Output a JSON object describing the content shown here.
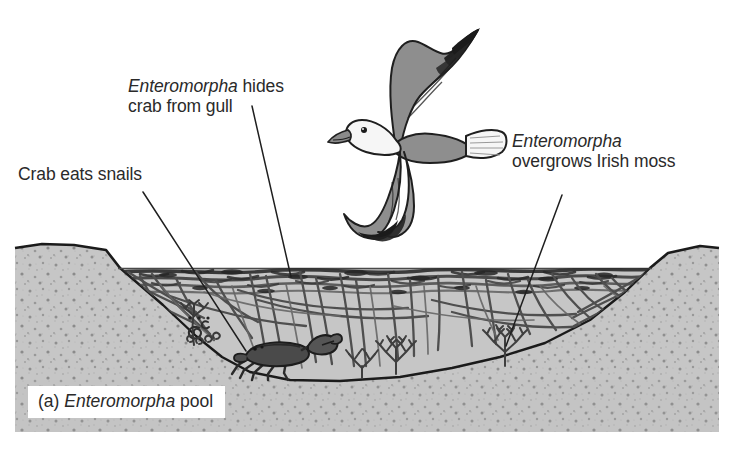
{
  "figure": {
    "caption_prefix": "(a) ",
    "caption_species": "Enteromorpha",
    "caption_suffix": " pool",
    "caption_full": "(a) Enteromorpha pool"
  },
  "labels": [
    {
      "id": "enteromorpha-hides-crab-from-gull",
      "species": "Enteromorpha",
      "rest": " hides\ncrab from gull",
      "full": "Enteromorpha hides crab from gull",
      "leader": {
        "x1": 252,
        "y1": 106,
        "x2": 291,
        "y2": 277
      }
    },
    {
      "id": "crab-eats-snails",
      "species": "",
      "rest": "Crab eats snails",
      "full": "Crab eats snails",
      "leader": {
        "x1": 143,
        "y1": 192,
        "x2": 246,
        "y2": 351
      }
    },
    {
      "id": "enteromorpha-overgrows-irish-moss",
      "species": "Enteromorpha",
      "rest": "\novergrows Irish moss",
      "full": "Enteromorpha overgrows Irish moss",
      "leader": {
        "x1": 562,
        "y1": 195,
        "x2": 506,
        "y2": 346
      }
    }
  ],
  "organisms": {
    "gull": "herring-gull-in-flight",
    "crab": "crab-on-pool-floor",
    "snails": "snail-cluster-on-algae",
    "irish_moss": "irish-moss-clumps",
    "enteromorpha": "enteromorpha-algae-canopy"
  },
  "colors": {
    "rock": "#c8c8c8",
    "rock_speckle": "#6e6e6e",
    "water": "#c4c4c4",
    "algae_dark": "#3a3a3a",
    "outline": "#1b1b1b",
    "gull_wing": "#8e8e8e",
    "gull_body": "#f4f4f4",
    "gull_tip": "#1b1b1b",
    "label_text": "#2a2a2a",
    "background": "#ffffff"
  },
  "geometry": {
    "rock_block": {
      "x": 15,
      "y": 245,
      "width": 704,
      "height": 187
    },
    "waterline_y": 268,
    "pool_left_x": 120,
    "pool_right_x": 650
  }
}
